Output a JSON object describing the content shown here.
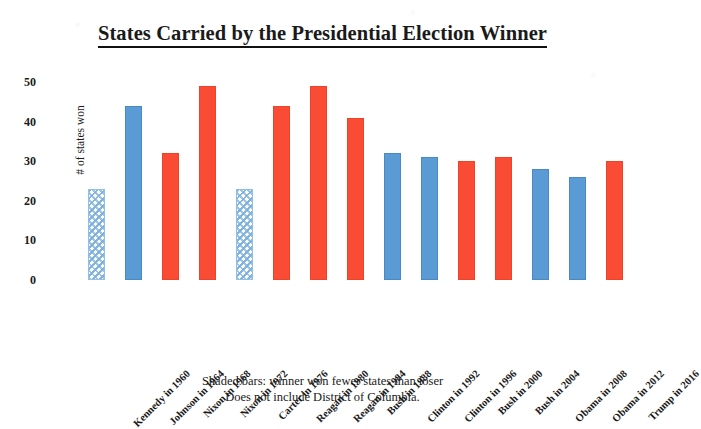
{
  "chart_data": {
    "type": "bar",
    "title": "States Carried by the Presidential Election Winner",
    "xlabel": "",
    "ylabel": "# of states won",
    "ylim": [
      0,
      50
    ],
    "yticks": [
      0,
      10,
      20,
      30,
      40,
      50
    ],
    "grid": false,
    "legend": "none",
    "categories": [
      "Kennedy in 1960",
      "Johnson in 1964",
      "Nixon in 1968",
      "Nixon in 1972",
      "Carter in 1976",
      "Reagan in 1980",
      "Reagan in 1984",
      "Bush in 1988",
      "Clinton in 1992",
      "Clinton in 1996",
      "Bush in 2000",
      "Bush in 2004",
      "Obama in 2008",
      "Obama in 2012",
      "Trump in 2016"
    ],
    "values": [
      23,
      44,
      32,
      49,
      23,
      44,
      49,
      41,
      32,
      31,
      30,
      31,
      28,
      26,
      30
    ],
    "bar_styles": [
      "hatched",
      "solid-blue",
      "solid-red",
      "solid-red",
      "hatched",
      "solid-red",
      "solid-red",
      "solid-red",
      "solid-blue",
      "solid-blue",
      "solid-red",
      "solid-red",
      "solid-blue",
      "solid-blue",
      "solid-red"
    ],
    "colors": {
      "democrat_blue": "#5b9bd5",
      "republican_red": "#fa4b34",
      "shaded_hatch_blue": "#7bb0de"
    },
    "annotations": [
      "Shaded bars:  winner won fewer states than loser",
      "Does not include District of Columbia."
    ]
  }
}
